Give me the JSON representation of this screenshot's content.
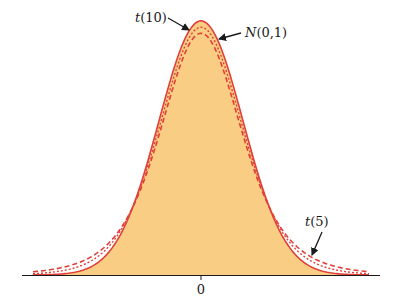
{
  "chart_data": {
    "type": "line",
    "title": "",
    "xlabel": "",
    "ylabel": "",
    "x_ticks": [
      "0"
    ],
    "xlim": [
      -4,
      4
    ],
    "grid": false,
    "legend": "none (curves labeled with arrow annotations)",
    "series": [
      {
        "name": "N(0,1)",
        "distribution": "standard normal",
        "style": "solid",
        "filled": true,
        "peak_density": 0.3989
      },
      {
        "name": "t(10)",
        "distribution": "Student t, 10 df",
        "style": "dotted",
        "filled": false,
        "peak_density": 0.3891
      },
      {
        "name": "t(5)",
        "distribution": "Student t, 5 df",
        "style": "dashed",
        "filled": false,
        "peak_density": 0.3796
      }
    ],
    "annotations": [
      {
        "text": "t(10)",
        "points_to": "t(10) curve near peak"
      },
      {
        "text": "N(0,1)",
        "points_to": "N(0,1) curve near peak"
      },
      {
        "text": "t(5)",
        "points_to": "t(5) curve in right tail"
      }
    ]
  },
  "colors": {
    "fill": "#F9CE84",
    "curve": "#E0403A",
    "axis": "#1a1a1a",
    "arrow": "#1a1a1a"
  },
  "labels": {
    "t10": "t(10)",
    "normal": "N(0,1)",
    "t5": "t(5)",
    "tick_zero": "0"
  }
}
